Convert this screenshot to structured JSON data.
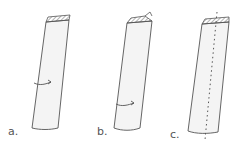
{
  "figure": {
    "panels": [
      {
        "id": "a",
        "label": "a.",
        "feature": "curved arrow across middle of tube"
      },
      {
        "id": "b",
        "label": "b.",
        "feature": "curved arrow near bottom of tube, folded top"
      },
      {
        "id": "c",
        "label": "c.",
        "feature": "dashed vertical fold line through tube"
      }
    ]
  },
  "colors": {
    "stroke": "#555555",
    "fill": "#f4f4f4",
    "background": "#ffffff"
  }
}
